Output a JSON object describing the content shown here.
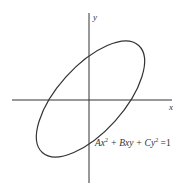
{
  "diagram": {
    "axes": {
      "x_label": "x",
      "y_label": "y"
    },
    "curve": {
      "type": "ellipse",
      "rotation_deg": -45
    },
    "equation": {
      "A": "Ax",
      "exp1": "2",
      "mid": " + Bxy + Cy",
      "exp2": "2",
      "rhs": " =1"
    },
    "colors": {
      "stroke": "#333333",
      "background": "#ffffff"
    }
  }
}
